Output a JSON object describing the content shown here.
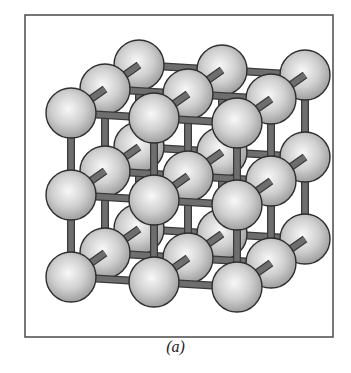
{
  "figure": {
    "caption": "(a)",
    "frame": {
      "x": 25,
      "y": 15,
      "width": 308,
      "height": 322
    },
    "lattice": {
      "size": [
        3,
        3,
        3
      ],
      "origin": [
        71,
        113
      ],
      "step_x": [
        83,
        5
      ],
      "step_y": [
        0,
        82
      ],
      "step_z": [
        34,
        -24
      ],
      "atom_radius": 25
    },
    "colors": {
      "atom_fill_light": "#f4f4f4",
      "atom_fill_dark": "#a8a8a8",
      "atom_stroke": "#2e2e2e",
      "bond": "#6e6e6e",
      "bond_stroke": "#3a3a3a",
      "frame": "#4a4a4a"
    }
  }
}
